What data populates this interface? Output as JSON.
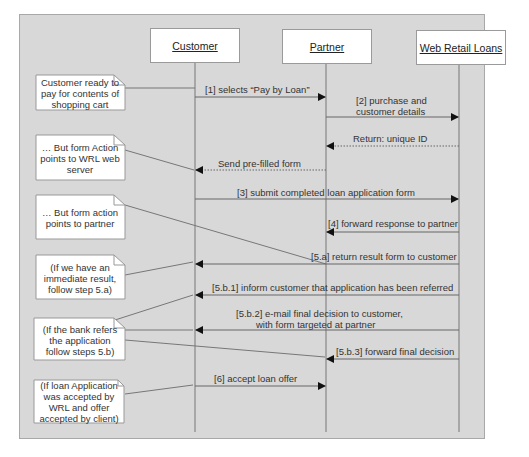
{
  "diagram": {
    "type": "sequence",
    "actors": [
      {
        "id": "customer",
        "label": "Customer"
      },
      {
        "id": "partner",
        "label": "Partner"
      },
      {
        "id": "wrl",
        "label": "Web Retail Loans"
      }
    ],
    "messages": [
      {
        "label": "[1] selects “Pay by Loan”",
        "from": "customer",
        "to": "partner",
        "style": "solid"
      },
      {
        "label_line1": "[2] purchase and",
        "label_line2": "customer details",
        "from": "partner",
        "to": "wrl",
        "style": "solid"
      },
      {
        "label": "Return: unique ID",
        "from": "wrl",
        "to": "partner",
        "style": "dotted"
      },
      {
        "label": "Send pre-filled form",
        "from": "partner",
        "to": "customer",
        "style": "dotted"
      },
      {
        "label": "[3] submit completed loan application form",
        "from": "customer",
        "to": "wrl",
        "style": "solid"
      },
      {
        "label": "[4] forward response to partner",
        "from": "wrl",
        "to": "partner",
        "style": "solid"
      },
      {
        "label": "[5.a] return result form to customer",
        "from": "wrl",
        "to": "customer",
        "style": "solid"
      },
      {
        "label": "[5.b.1] inform customer that application has been referred",
        "from": "wrl",
        "to": "customer",
        "style": "solid"
      },
      {
        "label_line1": "[5.b.2] e-mail final decision to customer,",
        "label_line2": "with form targeted at partner",
        "from": "wrl",
        "to": "customer",
        "style": "solid"
      },
      {
        "label": "[5.b.3] forward final decision",
        "from": "wrl",
        "to": "partner",
        "style": "solid"
      },
      {
        "label": "[6] accept loan offer",
        "from": "customer",
        "to": "partner",
        "style": "solid"
      }
    ],
    "notes": [
      {
        "text": "Customer ready to pay for contents of shopping cart"
      },
      {
        "text": "… But form Action points to WRL web server"
      },
      {
        "text": "… But form action points to partner"
      },
      {
        "text": "(If we have an immediate result, follow step 5.a)"
      },
      {
        "text": "(If the bank refers the application follow steps 5.b)"
      },
      {
        "text": "(If loan Application was accepted by WRL and offer accepted by client)"
      }
    ],
    "colors": {
      "background": "#d8d8d8",
      "box": "#ffffff",
      "line": "#666666",
      "text": "#222222"
    }
  }
}
